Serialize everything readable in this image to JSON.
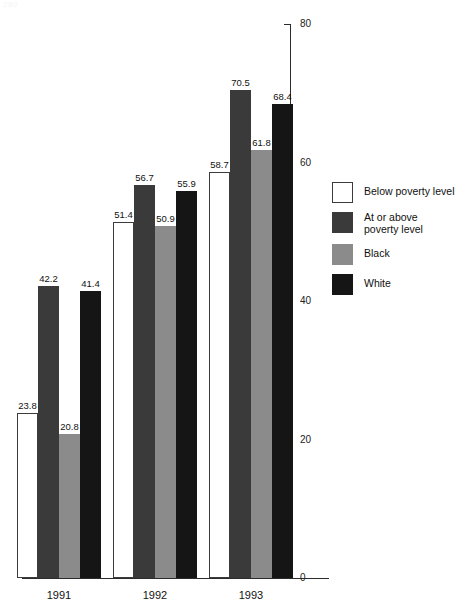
{
  "page": {
    "artifact_text": "280"
  },
  "chart_data": {
    "type": "bar",
    "title": "",
    "subtitle": "",
    "xlabel": "",
    "ylabel": "",
    "categories": [
      "1991",
      "1992",
      "1993"
    ],
    "ylim": [
      0,
      80
    ],
    "yticks": [
      0,
      20,
      40,
      60,
      80
    ],
    "ytick_labels": [
      "0",
      "20",
      "40",
      "60",
      "80"
    ],
    "grid": false,
    "legend_position": "right",
    "value_labels": true,
    "series": [
      {
        "name": "Below poverty level",
        "color": "#ffffff",
        "edge_color": "#3c3c3c",
        "values": [
          23.8,
          51.4,
          58.7
        ],
        "value_labels": [
          "23.8",
          "51.4",
          "58.7"
        ]
      },
      {
        "name": "At or above poverty level",
        "color": "#3a3a3a",
        "edge_color": "#3a3a3a",
        "values": [
          42.2,
          56.7,
          70.5
        ],
        "value_labels": [
          "42.2",
          "56.7",
          "70.5"
        ]
      },
      {
        "name": "Black",
        "color": "#8b8b8b",
        "edge_color": "#8b8b8b",
        "values": [
          20.8,
          50.9,
          61.8
        ],
        "value_labels": [
          "20.8",
          "50.9",
          "61.8"
        ]
      },
      {
        "name": "White",
        "color": "#151515",
        "edge_color": "#151515",
        "values": [
          41.4,
          55.9,
          68.4
        ],
        "value_labels": [
          "41.4",
          "55.9",
          "68.4"
        ]
      }
    ]
  },
  "legend": {
    "items": [
      {
        "label": "Below poverty level",
        "swatch": "s-below",
        "two_line": false
      },
      {
        "label": "At or above\npoverty level",
        "swatch": "s-ator",
        "two_line": true
      },
      {
        "label": "Black",
        "swatch": "s-black",
        "two_line": false
      },
      {
        "label": "White",
        "swatch": "s-white",
        "two_line": false
      }
    ]
  }
}
